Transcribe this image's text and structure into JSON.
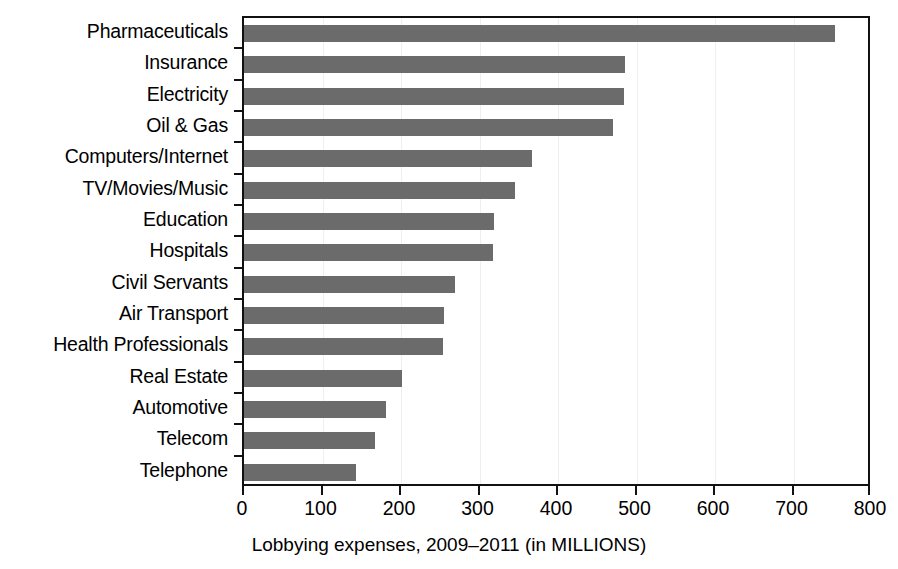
{
  "chart_data": {
    "type": "bar",
    "orientation": "horizontal",
    "title": "",
    "subtitle": "",
    "xlabel": "Lobbying expenses, 2009–2011 (in MILLIONS)",
    "ylabel": "",
    "categories": [
      "Pharmaceuticals",
      "Insurance",
      "Electricity",
      "Oil & Gas",
      "Computers/Internet",
      "TV/Movies/Music",
      "Education",
      "Hospitals",
      "Civil Servants",
      "Air Transport",
      "Health Professionals",
      "Real Estate",
      "Automotive",
      "Telecom",
      "Telephone"
    ],
    "values": [
      753,
      485,
      484,
      470,
      367,
      345,
      318,
      317,
      269,
      255,
      254,
      201,
      181,
      167,
      143
    ],
    "xlim": [
      0,
      800
    ],
    "xticks": [
      0,
      100,
      200,
      300,
      400,
      500,
      600,
      700,
      800
    ],
    "xtick_labels": [
      "0",
      "100",
      "200",
      "300",
      "400",
      "500",
      "600",
      "700",
      "800"
    ],
    "grid": "vertical-light",
    "legend": "none",
    "bar_color": "#6b6b6b",
    "frame_color": "#111111"
  },
  "caption": {
    "text": "Lobbying expenses, 2009–2011 (in MILLIONS)"
  }
}
